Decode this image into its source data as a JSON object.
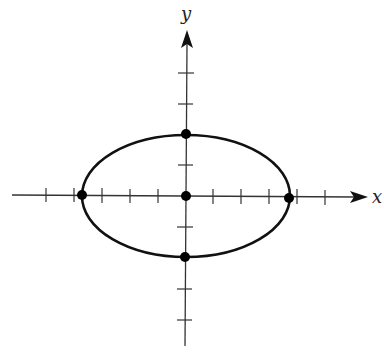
{
  "diagram": {
    "type": "ellipse-on-axes",
    "colors": {
      "ink": "#111111",
      "axis": "#333333",
      "background": "#ffffff"
    },
    "axes": {
      "x": {
        "label": "x",
        "tick_count_left": 5,
        "tick_count_right": 5
      },
      "y": {
        "label": "y",
        "tick_count_up": 3,
        "tick_count_down": 3
      }
    },
    "ellipse": {
      "center": "origin",
      "vertices": [
        "left",
        "right"
      ],
      "co_vertices": [
        "top",
        "bottom"
      ],
      "horizontal_semi_axis_px": 104,
      "vertical_semi_axis_px": 61
    },
    "points": [
      {
        "name": "center"
      },
      {
        "name": "left-vertex"
      },
      {
        "name": "right-vertex"
      },
      {
        "name": "top-co-vertex"
      },
      {
        "name": "bottom-co-vertex"
      }
    ]
  }
}
